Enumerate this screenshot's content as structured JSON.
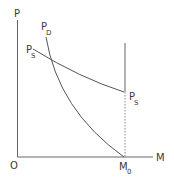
{
  "diagram": {
    "axes": {
      "y_label": "P",
      "x_label": "M",
      "origin_label": "O"
    },
    "curves": {
      "demand": {
        "label": "P",
        "subscript": "D"
      },
      "supply_start": {
        "label": "P",
        "subscript": "S"
      },
      "supply_end": {
        "label": "P",
        "subscript": "S"
      }
    },
    "markers": {
      "m0": {
        "label": "M",
        "subscript": "0"
      }
    },
    "colors": {
      "line": "#555555",
      "text": "#3a3a3a",
      "background": "#ffffff"
    }
  }
}
